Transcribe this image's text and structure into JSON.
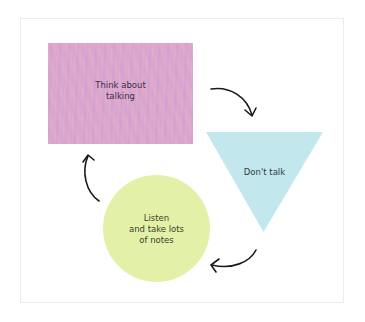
{
  "diagram": {
    "type": "cycle",
    "frame": {
      "border_color": "#ececec",
      "background": "#ffffff"
    },
    "nodes": [
      {
        "id": "think",
        "shape": "rectangle",
        "label": "Think about\ntalking",
        "color": "#daa6cf"
      },
      {
        "id": "dont-talk",
        "shape": "inverted-triangle",
        "label": "Don't talk",
        "color": "#c2e8ee"
      },
      {
        "id": "listen",
        "shape": "circle",
        "label": "Listen\nand take lots\nof notes",
        "color": "#e3f1a8"
      }
    ],
    "edges": [
      {
        "from": "think",
        "to": "dont-talk",
        "style": "curved-arrow"
      },
      {
        "from": "dont-talk",
        "to": "listen",
        "style": "curved-arrow"
      },
      {
        "from": "listen",
        "to": "think",
        "style": "curved-arrow"
      }
    ],
    "arrow_color": "#1a1a1a"
  }
}
